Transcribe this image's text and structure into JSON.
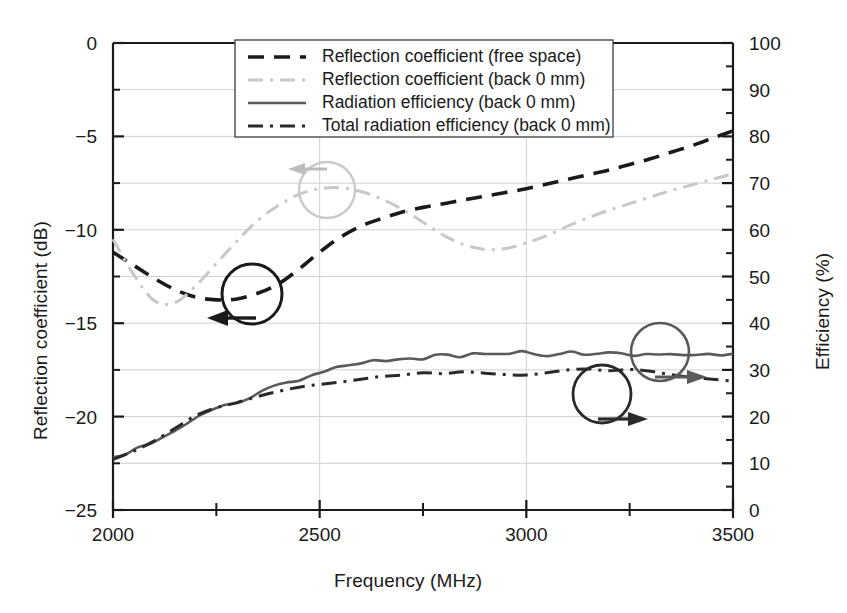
{
  "chart_data": {
    "type": "line",
    "title": "",
    "xlabel": "Frequency (MHz)",
    "ylabel": "Reflection coefficient (dB)",
    "ylabel_right": "Efficiency (%)",
    "xlim": [
      2000,
      3500
    ],
    "ylim": [
      -25,
      0
    ],
    "ylim_right": [
      0,
      100
    ],
    "xticks": [
      2000,
      2500,
      3000,
      3500
    ],
    "yticks": [
      -25,
      -20,
      -15,
      -10,
      -5,
      0
    ],
    "yticks_right": [
      0,
      10,
      20,
      30,
      40,
      50,
      60,
      70,
      80,
      90,
      100
    ],
    "xtick_labels": [
      "2000",
      "2500",
      "3000",
      "3500"
    ],
    "ytick_labels": [
      "−25",
      "−20",
      "−15",
      "−10",
      "−5",
      "0"
    ],
    "ytick_right_labels": [
      "0",
      "10",
      "20",
      "30",
      "40",
      "50",
      "60",
      "70",
      "80",
      "90",
      "100"
    ],
    "minor_ticks": true,
    "grid": true,
    "legend_position": "top-center",
    "series": [
      {
        "name": "Reflection coefficient (free space)",
        "axis": "left",
        "style": "dashed",
        "color": "#1a1a1a",
        "x": [
          2000,
          2050,
          2100,
          2150,
          2200,
          2250,
          2300,
          2350,
          2400,
          2450,
          2500,
          2550,
          2600,
          2650,
          2700,
          2750,
          2800,
          2850,
          2900,
          2950,
          3000,
          3050,
          3100,
          3150,
          3200,
          3250,
          3300,
          3350,
          3400,
          3450,
          3500
        ],
        "y": [
          -11.2,
          -11.9,
          -12.6,
          -13.2,
          -13.6,
          -13.75,
          -13.7,
          -13.4,
          -12.9,
          -12.1,
          -11.2,
          -10.4,
          -9.8,
          -9.4,
          -9.05,
          -8.8,
          -8.6,
          -8.4,
          -8.2,
          -8.0,
          -7.8,
          -7.55,
          -7.3,
          -7.05,
          -6.8,
          -6.5,
          -6.2,
          -5.85,
          -5.5,
          -5.1,
          -4.7
        ]
      },
      {
        "name": "Reflection coefficient (back 0 mm)",
        "axis": "left",
        "style": "dash-dot",
        "color": "#c8c8c8",
        "x": [
          2000,
          2050,
          2100,
          2150,
          2200,
          2250,
          2300,
          2350,
          2400,
          2450,
          2500,
          2550,
          2600,
          2650,
          2700,
          2750,
          2800,
          2850,
          2900,
          2950,
          3000,
          3050,
          3100,
          3150,
          3200,
          3250,
          3300,
          3350,
          3400,
          3450,
          3500
        ],
        "y": [
          -10.5,
          -12.4,
          -13.8,
          -13.9,
          -13.0,
          -11.8,
          -10.6,
          -9.5,
          -8.7,
          -8.1,
          -7.8,
          -7.75,
          -7.95,
          -8.35,
          -8.9,
          -9.6,
          -10.3,
          -10.8,
          -11.05,
          -11.0,
          -10.7,
          -10.3,
          -9.8,
          -9.35,
          -8.95,
          -8.6,
          -8.25,
          -7.9,
          -7.6,
          -7.3,
          -7.0
        ]
      },
      {
        "name": "Radiation efficiency (back 0 mm)",
        "axis": "right",
        "style": "solid",
        "color": "#5a5a5a",
        "x": [
          2000,
          2030,
          2060,
          2090,
          2120,
          2150,
          2180,
          2210,
          2240,
          2270,
          2300,
          2330,
          2360,
          2390,
          2420,
          2450,
          2480,
          2510,
          2540,
          2570,
          2600,
          2630,
          2660,
          2690,
          2720,
          2750,
          2780,
          2810,
          2840,
          2870,
          2900,
          2930,
          2960,
          2990,
          3020,
          3050,
          3080,
          3110,
          3140,
          3170,
          3200,
          3230,
          3260,
          3290,
          3320,
          3350,
          3380,
          3410,
          3440,
          3470,
          3500
        ],
        "y": [
          11.0,
          11.8,
          13.3,
          14.5,
          15.6,
          17.0,
          18.6,
          20.3,
          21.5,
          22.4,
          23.2,
          24.1,
          25.3,
          26.8,
          27.4,
          28.0,
          28.8,
          29.9,
          30.6,
          31.0,
          31.4,
          31.8,
          31.6,
          32.2,
          32.7,
          32.3,
          33.0,
          33.3,
          32.9,
          33.2,
          33.5,
          33.1,
          33.4,
          33.8,
          33.5,
          33.1,
          33.6,
          33.9,
          33.2,
          33.4,
          33.7,
          33.3,
          33.0,
          33.4,
          33.6,
          33.2,
          33.5,
          33.3,
          33.6,
          33.2,
          33.4
        ]
      },
      {
        "name": "Total radiation efficiency (back 0 mm)",
        "axis": "right",
        "style": "dash-dot",
        "color": "#2a2a2a",
        "x": [
          2000,
          2050,
          2100,
          2150,
          2200,
          2250,
          2300,
          2350,
          2400,
          2450,
          2500,
          2550,
          2600,
          2650,
          2700,
          2750,
          2800,
          2850,
          2900,
          2950,
          3000,
          3050,
          3100,
          3150,
          3200,
          3250,
          3300,
          3350,
          3400,
          3450,
          3500
        ],
        "y": [
          10.8,
          12.6,
          14.8,
          17.5,
          20.2,
          21.9,
          23.0,
          24.3,
          25.4,
          26.3,
          26.9,
          27.4,
          28.0,
          28.6,
          28.9,
          29.4,
          29.2,
          29.6,
          29.3,
          29.0,
          28.9,
          29.4,
          30.0,
          30.2,
          29.8,
          30.1,
          29.7,
          29.0,
          28.4,
          28.0,
          27.6
        ]
      }
    ],
    "annotations": [
      {
        "name": "left-axis-pointer-dark",
        "direction": "left",
        "color": "#1a1a1a",
        "target": "Reflection coefficient (free space)"
      },
      {
        "name": "left-axis-pointer-gray",
        "direction": "left",
        "color": "#bdbdbd",
        "target": "Reflection coefficient (back 0 mm)"
      },
      {
        "name": "right-axis-pointer-efficiency",
        "direction": "right",
        "color": "#5a5a5a",
        "target": "Radiation efficiency (back 0 mm)"
      },
      {
        "name": "right-axis-pointer-total-efficiency",
        "direction": "right",
        "color": "#2a2a2a",
        "target": "Total radiation efficiency (back 0 mm)"
      }
    ]
  },
  "legend": {
    "items": [
      {
        "label": "Reflection coefficient (free space)",
        "style": "dashed",
        "color": "#1a1a1a"
      },
      {
        "label": "Reflection coefficient (back 0 mm)",
        "style": "dash-dot",
        "color": "#c8c8c8"
      },
      {
        "label": "Radiation efficiency (back 0 mm)",
        "style": "solid",
        "color": "#5a5a5a"
      },
      {
        "label": "Total radiation efficiency (back 0 mm)",
        "style": "dash-dot",
        "color": "#2a2a2a"
      }
    ]
  }
}
